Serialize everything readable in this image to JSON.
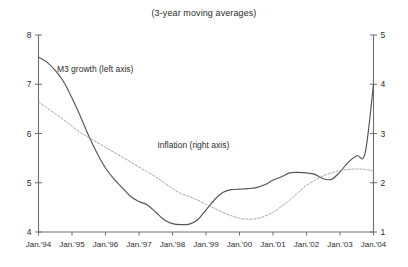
{
  "chart_data": {
    "type": "line",
    "title": "(3-year moving averages)",
    "xlabel": "",
    "ylabel": "",
    "grid": false,
    "legend_position": "inline-annotations",
    "x_tick_labels": [
      "Jan.'94",
      "Jan.'95",
      "Jan.'96",
      "Jan.'97",
      "Jan.'98",
      "Jan.'99",
      "Jan.'00",
      "Jan.'01",
      "Jan.'02",
      "Jan.'03",
      "Jan.'04"
    ],
    "x_range": [
      1994.0,
      2004.0
    ],
    "left_axis": {
      "label": "M3 growth (left axis)",
      "ticks": [
        "8",
        "7",
        "6",
        "5",
        "4"
      ],
      "tick_values": [
        8,
        7,
        6,
        5,
        4
      ],
      "ylim": [
        4,
        8
      ]
    },
    "right_axis": {
      "label": "Inflation (right axis)",
      "ticks": [
        "5",
        "4",
        "3",
        "2",
        "1"
      ],
      "tick_values": [
        5,
        4,
        3,
        2,
        1
      ],
      "ylim": [
        1,
        5
      ]
    },
    "series": [
      {
        "name": "M3 growth (left axis)",
        "axis": "left",
        "style": "solid",
        "color": "#555555",
        "x": [
          1994.0,
          1994.25,
          1994.5,
          1994.75,
          1995.0,
          1995.25,
          1995.5,
          1995.75,
          1996.0,
          1996.25,
          1996.5,
          1996.75,
          1997.0,
          1997.25,
          1997.5,
          1997.75,
          1998.0,
          1998.25,
          1998.5,
          1998.75,
          1999.0,
          1999.25,
          1999.5,
          1999.75,
          2000.0,
          2000.25,
          2000.5,
          2000.75,
          2001.0,
          2001.25,
          2001.5,
          2001.75,
          2002.0,
          2002.25,
          2002.5,
          2002.75,
          2003.0,
          2003.25,
          2003.5,
          2003.75,
          2004.0
        ],
        "y": [
          7.55,
          7.45,
          7.28,
          7.05,
          6.72,
          6.35,
          5.95,
          5.6,
          5.3,
          5.08,
          4.9,
          4.72,
          4.62,
          4.55,
          4.4,
          4.25,
          4.17,
          4.15,
          4.16,
          4.25,
          4.45,
          4.65,
          4.8,
          4.86,
          4.87,
          4.88,
          4.9,
          4.96,
          5.05,
          5.12,
          5.2,
          5.21,
          5.2,
          5.17,
          5.08,
          5.07,
          5.22,
          5.42,
          5.55,
          5.6,
          7.0
        ]
      },
      {
        "name": "Inflation (right axis)",
        "axis": "right",
        "style": "dashed",
        "color": "#9a9a9a",
        "x": [
          1994.0,
          1994.25,
          1994.5,
          1994.75,
          1995.0,
          1995.25,
          1995.5,
          1995.75,
          1996.0,
          1996.25,
          1996.5,
          1996.75,
          1997.0,
          1997.25,
          1997.5,
          1997.75,
          1998.0,
          1998.25,
          1998.5,
          1998.75,
          1999.0,
          1999.25,
          1999.5,
          1999.75,
          2000.0,
          2000.25,
          2000.5,
          2000.75,
          2001.0,
          2001.25,
          2001.5,
          2001.75,
          2002.0,
          2002.25,
          2002.5,
          2002.75,
          2003.0,
          2003.25,
          2003.5,
          2003.75,
          2004.0
        ],
        "y": [
          3.65,
          3.52,
          3.4,
          3.28,
          3.15,
          3.02,
          2.92,
          2.82,
          2.72,
          2.62,
          2.52,
          2.42,
          2.32,
          2.22,
          2.12,
          2.0,
          1.88,
          1.78,
          1.72,
          1.65,
          1.56,
          1.48,
          1.4,
          1.33,
          1.28,
          1.26,
          1.27,
          1.32,
          1.4,
          1.52,
          1.65,
          1.8,
          1.95,
          2.05,
          2.14,
          2.2,
          2.25,
          2.27,
          2.28,
          2.27,
          2.24
        ]
      }
    ],
    "annotations": [
      {
        "text": "M3 growth (left axis)",
        "x": 1994.55,
        "y_left": 7.25
      },
      {
        "text": "Inflation (right axis)",
        "x": 1997.55,
        "y_left": 5.7
      }
    ]
  }
}
